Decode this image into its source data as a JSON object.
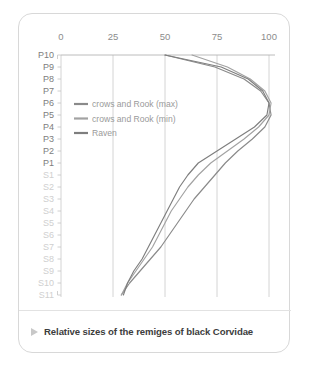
{
  "card": {
    "caption": {
      "marker": "triangle-right-icon",
      "text": "Relative sizes of the remiges of black Corvidae"
    }
  },
  "chart_data": {
    "type": "line",
    "title": "Relative sizes of the remiges of black Corvidae",
    "orientation": "horizontal-value-vertical-category",
    "xlabel": "",
    "ylabel": "",
    "xlim": [
      0,
      100
    ],
    "xticks": [
      0,
      25,
      50,
      75,
      100
    ],
    "xtick_labels": [
      "0",
      "25",
      "50",
      "75",
      "100"
    ],
    "grid": "vertical-gridlines-at-xticks",
    "legend_position": "upper-left-inside",
    "categories": [
      "P10",
      "P9",
      "P8",
      "P7",
      "P6",
      "P5",
      "P4",
      "P3",
      "P2",
      "P1",
      "S1",
      "S2",
      "S3",
      "S4",
      "S5",
      "S6",
      "S7",
      "S8",
      "S9",
      "S10",
      "S11"
    ],
    "category_groups": {
      "primaries": [
        "P10",
        "P9",
        "P8",
        "P7",
        "P6",
        "P5",
        "P4",
        "P3",
        "P2",
        "P1"
      ],
      "secondaries": [
        "S1",
        "S2",
        "S3",
        "S4",
        "S5",
        "S6",
        "S7",
        "S8",
        "S9",
        "S10",
        "S11"
      ]
    },
    "series": [
      {
        "name": "crows and Rook (max)",
        "color": "#8a8a8a",
        "values": [
          50,
          74,
          88,
          96,
          100,
          101,
          98,
          92,
          85,
          79,
          74,
          69,
          64,
          60,
          56,
          52,
          48,
          43,
          38,
          33,
          29
        ]
      },
      {
        "name": "crows and Rook (min)",
        "color": "#a2a2a2",
        "values": [
          63,
          80,
          91,
          98,
          101,
          100,
          95,
          88,
          80,
          72,
          66,
          61,
          57,
          53,
          50,
          47,
          44,
          40,
          36,
          32,
          29
        ]
      },
      {
        "name": "Raven",
        "color": "#7e7e7e",
        "values": [
          50,
          77,
          90,
          97,
          100,
          99,
          93,
          84,
          75,
          66,
          61,
          57,
          54,
          51,
          48,
          45,
          42,
          39,
          35,
          32,
          30
        ]
      }
    ]
  }
}
